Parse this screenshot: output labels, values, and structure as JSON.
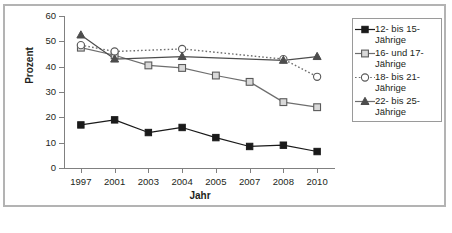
{
  "chart_data": {
    "type": "line",
    "title": "",
    "xlabel": "Jahr",
    "ylabel": "Prozent",
    "categories": [
      "1997",
      "2001",
      "2003",
      "2004",
      "2005",
      "2007",
      "2008",
      "2010"
    ],
    "ylim": [
      0,
      60
    ],
    "yticks": [
      0,
      10,
      20,
      30,
      40,
      50,
      60
    ],
    "grid": false,
    "legend_position": "right",
    "series": [
      {
        "name": "12- bis 15-Jährige",
        "marker": "filled-square",
        "color": "#1a1a1a",
        "linestyle": "solid",
        "x": [
          "1997",
          "2001",
          "2003",
          "2004",
          "2005",
          "2007",
          "2008",
          "2010"
        ],
        "values": [
          17,
          19,
          14,
          16,
          12,
          8.5,
          9,
          6.5
        ]
      },
      {
        "name": "16- und 17-Jährige",
        "marker": "open-square",
        "color": "#6e6e6e",
        "linestyle": "solid",
        "x": [
          "1997",
          "2001",
          "2003",
          "2004",
          "2005",
          "2007",
          "2008",
          "2010"
        ],
        "values": [
          47.5,
          44.5,
          40.5,
          39.5,
          36.5,
          34,
          26,
          24
        ]
      },
      {
        "name": "18- bis 21-Jährige",
        "marker": "open-circle",
        "color": "#6e6e6e",
        "linestyle": "dotted",
        "x": [
          "1997",
          "2001",
          "2004",
          "2008",
          "2010"
        ],
        "values": [
          48.5,
          46,
          47,
          43,
          36
        ]
      },
      {
        "name": "22- bis 25-Jährige",
        "marker": "filled-triangle",
        "color": "#4d4d4d",
        "linestyle": "solid",
        "x": [
          "1997",
          "2001",
          "2004",
          "2008",
          "2010"
        ],
        "values": [
          52.5,
          43,
          44,
          42.5,
          44
        ]
      }
    ]
  },
  "legend": {
    "items": [
      {
        "label_line1": "12- bis 15-",
        "label_line2": "Jährige",
        "marker": "filled-square"
      },
      {
        "label_line1": "16- und 17-",
        "label_line2": "Jährige",
        "marker": "open-square"
      },
      {
        "label_line1": "18- bis 21-",
        "label_line2": "Jährige",
        "marker": "open-circle"
      },
      {
        "label_line1": "22- bis 25-",
        "label_line2": "Jährige",
        "marker": "filled-triangle"
      }
    ]
  }
}
